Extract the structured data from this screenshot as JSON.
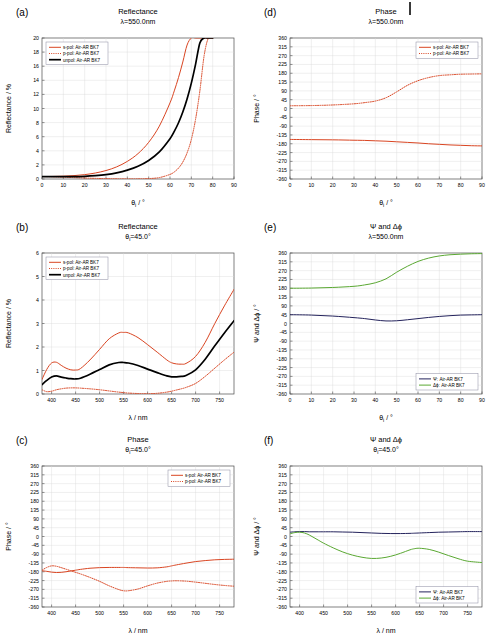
{
  "figure": {
    "background": "#ffffff",
    "top_mark": "vertical-tick-artifact"
  },
  "colors": {
    "s_pol": "#d94522",
    "p_pol": "#d94522",
    "unpol": "#000000",
    "psi": "#24235c",
    "delta_phi": "#5aa832",
    "grid": "#d8d8d8",
    "axis": "#4a4a4a"
  },
  "panels": [
    {
      "tag": "(a)",
      "title": "Reflectance",
      "subtitle": "λ=550.0nm",
      "xlabel": "θ",
      "xlabel_sub": "i",
      "xlabel_unit": " / °",
      "ylabel": "Reflectance / %",
      "xticks": [
        0,
        10,
        20,
        30,
        40,
        50,
        60,
        70,
        80,
        90
      ],
      "yticks": [
        0,
        2,
        4,
        6,
        8,
        10,
        12,
        14,
        16,
        18,
        20
      ],
      "legend_position": "top-left",
      "legend": [
        {
          "label": "s-pol: Air-AR BK7",
          "color_key": "s_pol",
          "style": "solid"
        },
        {
          "label": "p-pol: Air-AR BK7",
          "color_key": "p_pol",
          "style": "dotted"
        },
        {
          "label": "unpol: Air-AR BK7",
          "color_key": "unpol",
          "style": "solid-thick"
        }
      ]
    },
    {
      "tag": "(b)",
      "title": "Reflectance",
      "subtitle": "θi=45.0°",
      "xlabel": "λ",
      "xlabel_sub": "",
      "xlabel_unit": " / nm",
      "ylabel": "Reflectance / %",
      "xticks": [
        400,
        450,
        500,
        550,
        600,
        650,
        700,
        750
      ],
      "yticks": [
        0,
        1,
        2,
        3,
        4,
        5,
        6
      ],
      "legend_position": "top-left",
      "legend": [
        {
          "label": "s-pol: Air-AR BK7",
          "color_key": "s_pol",
          "style": "solid"
        },
        {
          "label": "p-pol: Air-AR BK7",
          "color_key": "p_pol",
          "style": "dotted"
        },
        {
          "label": "unpol: Air-AR BK7",
          "color_key": "unpol",
          "style": "solid-thick"
        }
      ]
    },
    {
      "tag": "(c)",
      "title": "Phase",
      "subtitle": "θi=45.0°",
      "xlabel": "λ",
      "xlabel_sub": "",
      "xlabel_unit": " / nm",
      "ylabel": "Phase / °",
      "xticks": [
        400,
        450,
        500,
        550,
        600,
        650,
        700,
        750
      ],
      "yticks": [
        -360,
        -315,
        -270,
        -225,
        -180,
        -135,
        -90,
        -45,
        0,
        45,
        90,
        135,
        180,
        225,
        270,
        315,
        360
      ],
      "legend_position": "top-right",
      "legend": [
        {
          "label": "s-pol: Air-AR BK7",
          "color_key": "s_pol",
          "style": "solid"
        },
        {
          "label": "p-pol: Air-AR BK7",
          "color_key": "p_pol",
          "style": "dotted"
        }
      ]
    },
    {
      "tag": "(d)",
      "title": "Phase",
      "subtitle": "λ=550.0nm",
      "xlabel": "θ",
      "xlabel_sub": "i",
      "xlabel_unit": " / °",
      "ylabel": "Phase / °",
      "xticks": [
        0,
        10,
        20,
        30,
        40,
        50,
        60,
        70,
        80,
        90
      ],
      "yticks": [
        -360,
        -315,
        -270,
        -225,
        -180,
        -135,
        -90,
        -45,
        0,
        45,
        90,
        135,
        180,
        225,
        270,
        315,
        360
      ],
      "legend_position": "top-right",
      "legend": [
        {
          "label": "s-pol: Air-AR BK7",
          "color_key": "s_pol",
          "style": "solid"
        },
        {
          "label": "p-pol: Air-AR BK7",
          "color_key": "p_pol",
          "style": "dotted"
        }
      ]
    },
    {
      "tag": "(e)",
      "title": "Ψ and Δϕ",
      "subtitle": "λ=550.0nm",
      "xlabel": "θ",
      "xlabel_sub": "i",
      "xlabel_unit": " / °",
      "ylabel": "Ψ and Δϕ / °",
      "xticks": [
        0,
        10,
        20,
        30,
        40,
        50,
        60,
        70,
        80,
        90
      ],
      "yticks": [
        -360,
        -315,
        -270,
        -225,
        -180,
        -135,
        -90,
        -45,
        0,
        45,
        90,
        135,
        180,
        225,
        270,
        315,
        360
      ],
      "legend_position": "bottom-right",
      "legend": [
        {
          "label": "Ψ: Air-AR BK7",
          "color_key": "psi",
          "style": "solid"
        },
        {
          "label": "Δϕ: Air-AR BK7",
          "color_key": "delta_phi",
          "style": "solid"
        }
      ]
    },
    {
      "tag": "(f)",
      "title": "Ψ and Δϕ",
      "subtitle": "θi=45.0°",
      "xlabel": "λ",
      "xlabel_sub": "",
      "xlabel_unit": " / nm",
      "ylabel": "Ψ and Δϕ / °",
      "xticks": [
        400,
        450,
        500,
        550,
        600,
        650,
        700,
        750
      ],
      "yticks": [
        -360,
        -315,
        -270,
        -225,
        -180,
        -135,
        -90,
        -45,
        0,
        45,
        90,
        135,
        180,
        225,
        270,
        315,
        360
      ],
      "legend_position": "bottom-right",
      "legend": [
        {
          "label": "Ψ: Air-AR BK7",
          "color_key": "psi",
          "style": "solid"
        },
        {
          "label": "Δϕ: Air-AR BK7",
          "color_key": "delta_phi",
          "style": "solid"
        }
      ]
    }
  ],
  "chart_data": [
    {
      "panel": "(a)",
      "type": "line",
      "title": "Reflectance",
      "subtitle": "λ=550.0nm",
      "xlabel": "θi / °",
      "ylabel": "Reflectance / %",
      "xlim": [
        0,
        90
      ],
      "ylim": [
        0,
        20
      ],
      "grid": true,
      "legend_position": "top-left",
      "x": [
        0,
        5,
        10,
        15,
        20,
        25,
        30,
        35,
        40,
        45,
        50,
        55,
        60,
        62,
        64,
        66,
        68,
        70,
        72,
        74,
        76,
        78,
        80
      ],
      "series": [
        {
          "name": "s-pol: Air-AR BK7",
          "style": "solid",
          "color": "#d94522",
          "values": [
            0.35,
            0.36,
            0.4,
            0.48,
            0.62,
            0.85,
            1.2,
            1.72,
            2.5,
            3.6,
            5.2,
            7.5,
            10.8,
            12.5,
            14.4,
            16.6,
            19.0,
            20,
            20,
            20,
            20,
            20,
            20
          ]
        },
        {
          "name": "p-pol: Air-AR BK7",
          "style": "dotted",
          "color": "#d94522",
          "values": [
            0.35,
            0.32,
            0.26,
            0.2,
            0.14,
            0.09,
            0.05,
            0.02,
            0.01,
            0.02,
            0.06,
            0.2,
            0.65,
            1.0,
            1.55,
            2.4,
            3.7,
            5.6,
            8.5,
            12.5,
            17.5,
            20,
            20
          ]
        },
        {
          "name": "unpol: Air-AR BK7",
          "style": "solid-thick",
          "color": "#000000",
          "values": [
            0.35,
            0.34,
            0.33,
            0.34,
            0.38,
            0.47,
            0.62,
            0.87,
            1.26,
            1.81,
            2.63,
            3.85,
            5.72,
            6.75,
            7.98,
            9.5,
            11.35,
            13.6,
            16.3,
            19.3,
            20,
            20,
            20
          ]
        }
      ]
    },
    {
      "panel": "(b)",
      "type": "line",
      "title": "Reflectance",
      "subtitle": "θi=45.0°",
      "xlabel": "λ / nm",
      "ylabel": "Reflectance / %",
      "xlim": [
        380,
        780
      ],
      "ylim": [
        0,
        6
      ],
      "grid": true,
      "legend_position": "top-left",
      "x": [
        380,
        390,
        400,
        410,
        420,
        430,
        440,
        450,
        460,
        480,
        500,
        520,
        540,
        550,
        560,
        580,
        600,
        620,
        640,
        650,
        660,
        670,
        680,
        700,
        720,
        740,
        760,
        780
      ],
      "series": [
        {
          "name": "s-pol: Air-AR BK7",
          "style": "solid",
          "color": "#d94522",
          "values": [
            0.62,
            1.05,
            1.32,
            1.35,
            1.22,
            1.1,
            1.03,
            1.02,
            1.08,
            1.45,
            1.9,
            2.35,
            2.6,
            2.62,
            2.6,
            2.4,
            2.1,
            1.78,
            1.45,
            1.33,
            1.28,
            1.27,
            1.3,
            1.6,
            2.2,
            3.0,
            3.75,
            4.45
          ]
        },
        {
          "name": "p-pol: Air-AR BK7",
          "style": "dotted",
          "color": "#d94522",
          "values": [
            0.18,
            0.1,
            0.12,
            0.18,
            0.22,
            0.25,
            0.26,
            0.26,
            0.25,
            0.22,
            0.18,
            0.13,
            0.08,
            0.06,
            0.04,
            0.02,
            0.01,
            0.03,
            0.08,
            0.12,
            0.17,
            0.22,
            0.28,
            0.45,
            0.75,
            1.1,
            1.45,
            1.78
          ]
        },
        {
          "name": "unpol: Air-AR BK7",
          "style": "solid-thick",
          "color": "#000000",
          "values": [
            0.4,
            0.58,
            0.72,
            0.77,
            0.72,
            0.68,
            0.65,
            0.64,
            0.67,
            0.84,
            1.04,
            1.24,
            1.34,
            1.34,
            1.32,
            1.21,
            1.06,
            0.91,
            0.77,
            0.73,
            0.73,
            0.75,
            0.79,
            1.03,
            1.48,
            2.05,
            2.6,
            3.12
          ]
        }
      ]
    },
    {
      "panel": "(c)",
      "type": "line",
      "title": "Phase",
      "subtitle": "θi=45.0°",
      "xlabel": "λ / nm",
      "ylabel": "Phase / °",
      "xlim": [
        380,
        780
      ],
      "ylim": [
        -360,
        360
      ],
      "grid": true,
      "legend_position": "top-right",
      "x": [
        380,
        390,
        400,
        410,
        420,
        430,
        440,
        450,
        460,
        480,
        500,
        520,
        540,
        550,
        560,
        580,
        600,
        620,
        640,
        650,
        660,
        680,
        700,
        720,
        740,
        760,
        780
      ],
      "series": [
        {
          "name": "s-pol: Air-AR BK7",
          "style": "solid",
          "color": "#d94522",
          "values": [
            -175,
            -178,
            -182,
            -184,
            -183,
            -180,
            -176,
            -172,
            -168,
            -162,
            -159,
            -158,
            -158,
            -158,
            -159,
            -160,
            -161,
            -160,
            -155,
            -150,
            -145,
            -136,
            -128,
            -123,
            -119,
            -117,
            -116
          ]
        },
        {
          "name": "p-pol: Air-AR BK7",
          "style": "dotted",
          "color": "#d94522",
          "values": [
            -172,
            -158,
            -150,
            -152,
            -159,
            -167,
            -175,
            -183,
            -191,
            -209,
            -229,
            -252,
            -271,
            -277,
            -277,
            -268,
            -252,
            -238,
            -229,
            -227,
            -226,
            -228,
            -233,
            -239,
            -245,
            -250,
            -254
          ]
        }
      ]
    },
    {
      "panel": "(d)",
      "type": "line",
      "title": "Phase",
      "subtitle": "λ=550.0nm",
      "xlabel": "θi / °",
      "ylabel": "Phase / °",
      "xlim": [
        0,
        90
      ],
      "ylim": [
        -360,
        360
      ],
      "grid": true,
      "legend_position": "top-right",
      "x": [
        0,
        10,
        20,
        30,
        35,
        40,
        45,
        50,
        55,
        60,
        65,
        70,
        75,
        80,
        85,
        90
      ],
      "series": [
        {
          "name": "s-pol: Air-AR BK7",
          "style": "solid",
          "color": "#d94522",
          "values": [
            -158,
            -159,
            -160,
            -162,
            -163,
            -165,
            -167,
            -170,
            -173,
            -176,
            -180,
            -183,
            -186,
            -188,
            -190,
            -191
          ]
        },
        {
          "name": "p-pol: Air-AR BK7",
          "style": "dotted",
          "color": "#d94522",
          "values": [
            14,
            15,
            18,
            24,
            30,
            38,
            55,
            85,
            118,
            142,
            158,
            168,
            172,
            175,
            176,
            177
          ]
        }
      ]
    },
    {
      "panel": "(e)",
      "type": "line",
      "title": "Ψ and Δϕ",
      "subtitle": "λ=550.0nm",
      "xlabel": "θi / °",
      "ylabel": "Ψ and Δϕ / °",
      "xlim": [
        0,
        90
      ],
      "ylim": [
        -360,
        360
      ],
      "grid": true,
      "legend_position": "bottom-right",
      "x": [
        0,
        10,
        20,
        30,
        35,
        40,
        45,
        50,
        55,
        60,
        65,
        70,
        75,
        80,
        85,
        90
      ],
      "series": [
        {
          "name": "Ψ: Air-AR BK7",
          "style": "solid",
          "color": "#24235c",
          "values": [
            45,
            43,
            38,
            30,
            25,
            18,
            13,
            14,
            19,
            25,
            31,
            36,
            40,
            43,
            44,
            45
          ]
        },
        {
          "name": "Δϕ: Air-AR BK7",
          "style": "solid",
          "color": "#5aa832",
          "values": [
            180,
            181,
            184,
            190,
            197,
            208,
            228,
            262,
            292,
            317,
            334,
            345,
            351,
            354,
            356,
            357
          ]
        }
      ]
    },
    {
      "panel": "(f)",
      "type": "line",
      "title": "Ψ and Δϕ",
      "subtitle": "θi=45.0°",
      "xlabel": "λ / nm",
      "ylabel": "Ψ and Δϕ / °",
      "xlim": [
        380,
        780
      ],
      "ylim": [
        -360,
        360
      ],
      "grid": true,
      "legend_position": "bottom-right",
      "x": [
        380,
        390,
        400,
        410,
        420,
        430,
        440,
        450,
        470,
        490,
        510,
        530,
        550,
        570,
        590,
        610,
        630,
        640,
        650,
        670,
        690,
        710,
        730,
        750,
        780
      ],
      "series": [
        {
          "name": "Ψ: Air-AR BK7",
          "style": "solid",
          "color": "#24235c",
          "values": [
            22,
            24,
            25,
            25,
            24,
            24,
            24,
            24,
            24,
            23,
            22,
            20,
            18,
            16,
            15,
            15,
            16,
            17,
            18,
            20,
            22,
            23,
            24,
            25,
            25
          ]
        },
        {
          "name": "Δϕ: Air-AR BK7",
          "style": "solid",
          "color": "#5aa832",
          "values": [
            14,
            20,
            22,
            18,
            8,
            -6,
            -20,
            -34,
            -58,
            -79,
            -95,
            -106,
            -112,
            -110,
            -101,
            -86,
            -68,
            -62,
            -60,
            -66,
            -80,
            -97,
            -113,
            -126,
            -133
          ]
        }
      ]
    }
  ]
}
